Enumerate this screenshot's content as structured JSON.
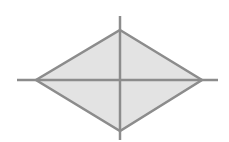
{
  "diagram": {
    "shape": "rhombus",
    "vertices": {
      "top": [
        120,
        30
      ],
      "right": [
        202,
        80
      ],
      "bottom": [
        120,
        131
      ],
      "left": [
        36,
        80
      ]
    },
    "horizontal_axis": {
      "x1": 17,
      "y1": 80,
      "x2": 218,
      "y2": 80
    },
    "vertical_axis": {
      "x1": 120,
      "y1": 16,
      "x2": 120,
      "y2": 140
    },
    "colors": {
      "fill": "#e3e3e3",
      "stroke": "#8c8c8c",
      "background": "#ffffff"
    },
    "stroke_width": 2.5
  }
}
